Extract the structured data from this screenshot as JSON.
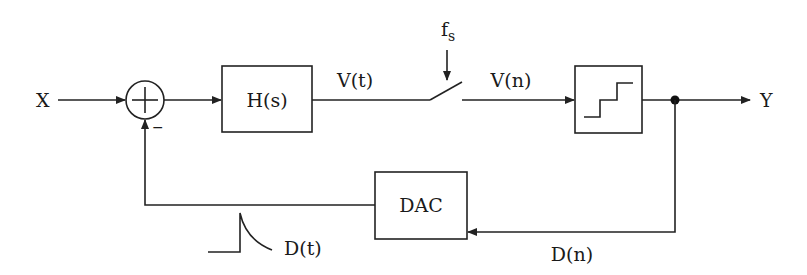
{
  "diagram": {
    "type": "block-diagram",
    "title": "",
    "input_label": "X",
    "output_label": "Y",
    "summing_junction": {
      "symbol": "+",
      "feedback_sign": "−"
    },
    "blocks": {
      "filter": "H(s)",
      "dac": "DAC",
      "quantizer": "quantizer (staircase)"
    },
    "signals": {
      "vt": "V(t)",
      "vn": "V(n)",
      "dn": "D(n)",
      "dt": "D(t)",
      "fs_main": "f",
      "fs_sub": "s"
    },
    "colors": {
      "line": "#222222",
      "background": "#ffffff"
    }
  }
}
